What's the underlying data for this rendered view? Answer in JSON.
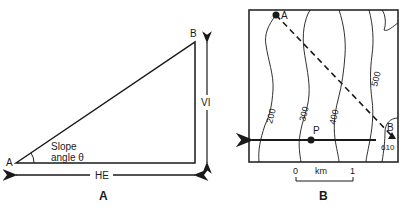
{
  "panel_a": {
    "caption": "A",
    "point_a": "A",
    "point_b": "B",
    "slope_line1": "Slope",
    "slope_line2": "angle θ",
    "horizontal_label": "HE",
    "vertical_label": "VI"
  },
  "panel_b": {
    "caption": "B",
    "point_a": "A",
    "point_b": "B",
    "point_p": "P",
    "spot_height": "610",
    "contours": [
      "200",
      "300",
      "400",
      "500"
    ],
    "scale": {
      "start": "0",
      "unit": "km",
      "end": "1"
    }
  },
  "colors": {
    "ink": "#1a1a1a",
    "background": "#ffffff"
  }
}
